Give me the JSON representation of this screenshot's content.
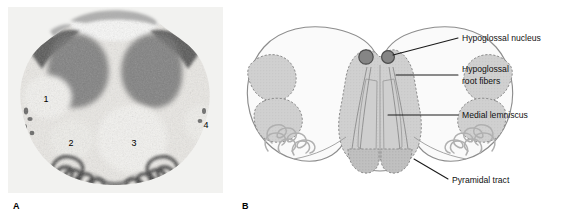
{
  "figure": {
    "type": "anatomical-cross-section",
    "panels": [
      {
        "id": "A",
        "letter": "A",
        "kind": "photomicrograph",
        "region_numbers": [
          {
            "number": "1",
            "x": 38,
            "y": 92
          },
          {
            "number": "2",
            "x": 63,
            "y": 136
          },
          {
            "number": "3",
            "x": 126,
            "y": 136
          },
          {
            "number": "4",
            "x": 198,
            "y": 118
          }
        ]
      },
      {
        "id": "B",
        "letter": "B",
        "kind": "line-drawing",
        "labels": [
          {
            "id": "hypoglossal-nucleus",
            "text": "Hypoglossal nucleus",
            "line1": "Hypoglossal nucleus",
            "line2": ""
          },
          {
            "id": "hypoglossal-root-fibers",
            "text": "Hypoglossal root fibers",
            "line1": "Hypoglossal",
            "line2": "root fibers"
          },
          {
            "id": "medial-lemniscus",
            "text": "Medial lemniscus",
            "line1": "Medial lemniscus",
            "line2": ""
          },
          {
            "id": "pyramidal-tract",
            "text": "Pyramidal tract",
            "line1": "Pyramidal tract",
            "line2": ""
          }
        ]
      }
    ]
  },
  "colors": {
    "outline": "#8d8d8d",
    "shade_light": "#d2d2d2",
    "shade_mid": "#c2c2c2",
    "shade_dark": "#9a9a9a",
    "nucleus_fill": "#858585",
    "nucleus_stroke": "#4d4d4d",
    "leader_line": "#1a1a1a",
    "text": "#111111",
    "background": "#ffffff"
  }
}
